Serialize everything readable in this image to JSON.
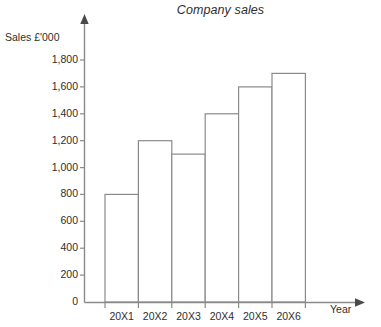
{
  "chart_data": {
    "type": "bar",
    "title": "Company sales",
    "xlabel": "Year",
    "ylabel": "Sales £'000",
    "categories": [
      "20X1",
      "20X2",
      "20X3",
      "20X4",
      "20X5",
      "20X6"
    ],
    "values": [
      800,
      1200,
      1100,
      1400,
      1600,
      1700
    ],
    "ylim": [
      0,
      1800
    ],
    "ytick_values": [
      0,
      200,
      400,
      600,
      800,
      1000,
      1200,
      1400,
      1600,
      1800
    ],
    "ytick_labels": [
      "0",
      "200",
      "400",
      "600",
      "800",
      "1,000",
      "1,200",
      "1,400",
      "1,600",
      "1,800"
    ],
    "grid": false,
    "legend": null,
    "bar_fill_color": "#ffffff",
    "bar_edge_color": "#8a8a8a",
    "axis_color": "#8a8a8a",
    "text_color": "#2e2e2e"
  }
}
